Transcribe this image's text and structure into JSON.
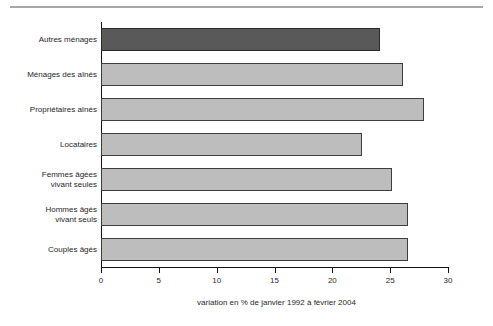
{
  "figure": {
    "partial_top_text": "",
    "background": "#ffffff"
  },
  "colors": {
    "bar_highlight": "#595959",
    "bar_default": "#bdbdbd",
    "bar_border": "#3d3d3d",
    "axis": "#111111",
    "rule": "#a8a8a8"
  },
  "chart_data": {
    "type": "bar",
    "orientation": "horizontal",
    "title": "",
    "subtitle": "",
    "xlabel": "variation en % de janvier 1992 à février 2004",
    "ylabel": "",
    "xlim": [
      0,
      30
    ],
    "xticks": [
      0,
      5,
      10,
      15,
      20,
      25,
      30
    ],
    "xtick_labels": [
      "0",
      "5",
      "10",
      "15",
      "20",
      "25",
      "30"
    ],
    "grid": false,
    "legend": null,
    "categories": [
      "Autres ménages",
      "Ménages des aînés",
      "Propriétaires aînés",
      "Locataires",
      "Femmes âgées\nvivant seules",
      "Hommes âgés\nvivant seuls",
      "Couples âgés"
    ],
    "values": [
      24.1,
      26.1,
      27.9,
      22.6,
      25.2,
      26.5,
      26.5
    ],
    "highlighted": [
      true,
      false,
      false,
      false,
      false,
      false,
      false
    ],
    "annotations": []
  }
}
